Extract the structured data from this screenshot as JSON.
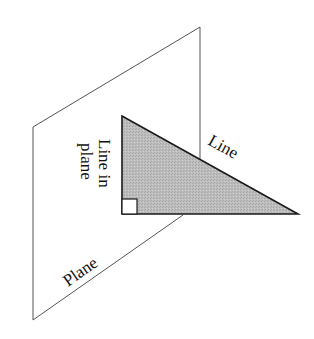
{
  "diagram": {
    "labels": {
      "line": "Line",
      "line_in_plane_1": "Line in",
      "line_in_plane_2": "plane",
      "plane": "Plane"
    },
    "shapes": {
      "plane": {
        "points": [
          [
            33,
            127
          ],
          [
            200,
            27
          ],
          [
            200,
            160
          ]
        ],
        "lower_edge": [
          [
            183,
            215
          ],
          [
            33,
            320
          ]
        ],
        "left_edge": [
          [
            33,
            127
          ],
          [
            33,
            320
          ]
        ],
        "stroke": "#555555"
      },
      "triangle": {
        "points": [
          [
            122,
            116
          ],
          [
            298,
            214
          ],
          [
            122,
            214
          ]
        ],
        "fill": "#b8b8b8",
        "stroke": "#1a1a1a"
      },
      "right_angle_marker": {
        "x": 122,
        "y": 199,
        "size": 15,
        "fill": "#ffffff"
      }
    },
    "colors": {
      "background": "#ffffff",
      "plane_stroke": "#555555",
      "triangle_fill": "#b8b8b8",
      "triangle_stroke": "#1a1a1a",
      "text": "#111111"
    }
  }
}
